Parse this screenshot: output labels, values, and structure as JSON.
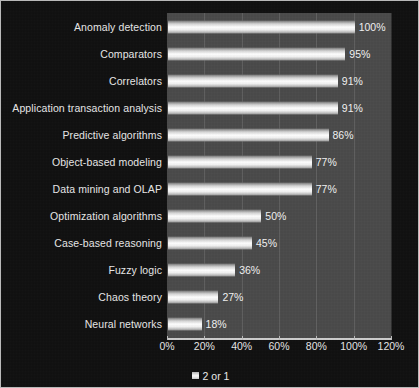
{
  "chart_data": {
    "type": "bar",
    "orientation": "horizontal",
    "title": "",
    "xlabel": "",
    "ylabel": "",
    "categories": [
      "Anomaly detection",
      "Comparators",
      "Correlators",
      "Application transaction analysis",
      "Predictive algorithms",
      "Object-based modeling",
      "Data mining and OLAP",
      "Optimization algorithms",
      "Case-based reasoning",
      "Fuzzy logic",
      "Chaos theory",
      "Neural networks"
    ],
    "values": [
      100,
      95,
      91,
      91,
      86,
      77,
      77,
      50,
      45,
      36,
      27,
      18
    ],
    "value_labels": [
      "100%",
      "95%",
      "91%",
      "91%",
      "86%",
      "77%",
      "77%",
      "50%",
      "45%",
      "36%",
      "27%",
      "18%"
    ],
    "xlim": [
      0,
      120
    ],
    "xtick_values": [
      0,
      20,
      40,
      60,
      80,
      100,
      120
    ],
    "xtick_labels": [
      "0%",
      "20%",
      "40%",
      "60%",
      "80%",
      "100%",
      "120%"
    ],
    "grid": true,
    "legend": {
      "position": "bottom-center",
      "entries": [
        {
          "label": "2 or 1",
          "marker": "square-swatch"
        }
      ]
    },
    "colors": {
      "figure_background": "#111111",
      "plot_background": "#4b4b4b",
      "bar_fill": "#ffffff",
      "text": "#e8e8e8",
      "axis": "#cccccc",
      "border": "#b9b9b9"
    }
  }
}
